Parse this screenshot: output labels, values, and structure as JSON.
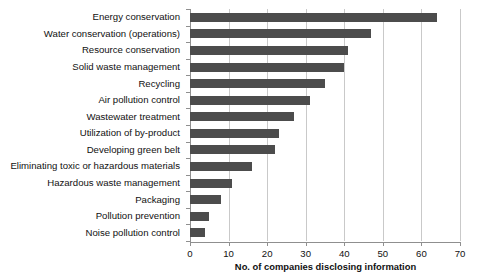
{
  "chart_data": {
    "type": "bar",
    "orientation": "horizontal",
    "title": "",
    "subtitle": "",
    "xlabel": "No. of companies disclosing information",
    "ylabel": "",
    "xlim": [
      0,
      70
    ],
    "xticks": [
      0,
      10,
      20,
      30,
      40,
      50,
      60,
      70
    ],
    "xtick_labels": [
      "0",
      "10",
      "20",
      "30",
      "40",
      "50",
      "60",
      "70"
    ],
    "grid": true,
    "grid_axis": "x",
    "legend": false,
    "legend_position": "none",
    "bar_color": "#4c4c4c",
    "gridline_color": "#c9c9c9",
    "axis_color": "#8f8f8f",
    "background_color": "#ffffff",
    "categories": [
      "Energy conservation",
      "Water conservation (operations)",
      "Resource conservation",
      "Solid waste management",
      "Recycling",
      "Air pollution control",
      "Wastewater treatment",
      "Utilization of by-product",
      "Developing green belt",
      "Eliminating toxic or hazardous materials",
      "Hazardous waste management",
      "Packaging",
      "Pollution prevention",
      "Noise pollution control"
    ],
    "values": [
      64,
      47,
      41,
      40,
      35,
      31,
      27,
      23,
      22,
      16,
      11,
      8,
      5,
      4
    ],
    "series": [
      {
        "name": "No. of companies disclosing information",
        "values": [
          64,
          47,
          41,
          40,
          35,
          31,
          27,
          23,
          22,
          16,
          11,
          8,
          5,
          4
        ]
      }
    ]
  }
}
